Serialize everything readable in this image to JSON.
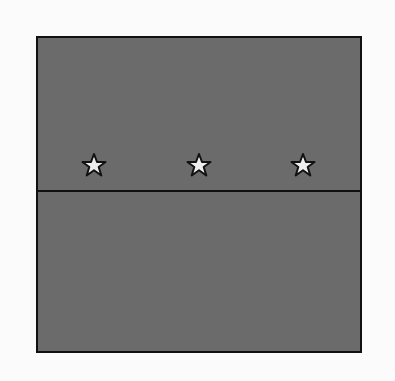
{
  "diagram": {
    "background": "#fbfbfb",
    "panel_fill": "#6b6b6b",
    "border_color": "#111111",
    "star_fill": "#eeeeee",
    "stars": [
      {
        "icon": "star-icon",
        "x": 94,
        "y": 165
      },
      {
        "icon": "star-icon",
        "x": 199,
        "y": 165
      },
      {
        "icon": "star-icon",
        "x": 303,
        "y": 165
      }
    ]
  }
}
